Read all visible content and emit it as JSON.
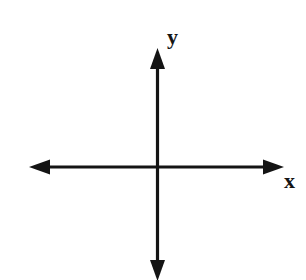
{
  "figure": {
    "background_color": "#ffffff",
    "stroke_color": "#141414",
    "stroke_width": 3.2,
    "width": 306,
    "height": 280
  },
  "origin": {
    "x": 157,
    "y": 167
  },
  "axes": [
    {
      "name": "x-axis",
      "orientation": "horizontal",
      "label": "x",
      "start": {
        "x": 29,
        "y": 167
      },
      "end": {
        "x": 284,
        "y": 167
      },
      "arrowheads": [
        "start",
        "end"
      ],
      "label_position": {
        "x": 284,
        "y": 170
      }
    },
    {
      "name": "y-axis",
      "orientation": "vertical",
      "label": "y",
      "start": {
        "x": 157,
        "y": 280
      },
      "end": {
        "x": 157,
        "y": 48
      },
      "arrowheads": [
        "start",
        "end"
      ],
      "label_position": {
        "x": 167,
        "y": 26
      }
    }
  ],
  "arrowhead": {
    "width": 15,
    "length": 21,
    "style": "solid-triangle"
  },
  "labels": {
    "x": "x",
    "y": "y"
  }
}
